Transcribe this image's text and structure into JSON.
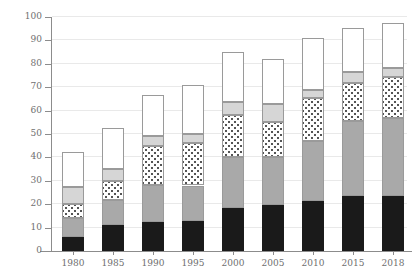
{
  "chart_data": {
    "type": "bar",
    "subtype": "stacked-bar",
    "title": "",
    "subtitle": "",
    "xlabel": "",
    "ylabel": "",
    "grid": true,
    "legend_position": "none",
    "categories": [
      "1980",
      "1985",
      "1990",
      "1995",
      "2000",
      "2005",
      "2010",
      "2015",
      "2018"
    ],
    "ylim": [
      0,
      100
    ],
    "yticks": [
      0,
      10,
      20,
      30,
      40,
      50,
      60,
      70,
      80,
      90,
      100
    ],
    "ytick_labels": [
      "0",
      "10",
      "20",
      "30",
      "40",
      "50",
      "60",
      "70",
      "80",
      "90",
      "100"
    ],
    "series": [
      {
        "name": "segment-1",
        "fill": "solid-black",
        "color": "#1a1a1a",
        "values": [
          6,
          11,
          12.5,
          13,
          18.5,
          19.5,
          21.5,
          23.5,
          23.5
        ]
      },
      {
        "name": "segment-2",
        "fill": "solid-gray",
        "color": "#a9a9a9",
        "values": [
          8,
          11,
          15.5,
          15,
          21.5,
          20.5,
          25.5,
          32,
          33.5
        ]
      },
      {
        "name": "segment-3",
        "fill": "dotted",
        "color": "#ffffff",
        "values": [
          6,
          8,
          17,
          18,
          18,
          15,
          18.5,
          16.5,
          17.5
        ]
      },
      {
        "name": "segment-4",
        "fill": "light-gray",
        "color": "#d6d6d6",
        "values": [
          7.5,
          5,
          4,
          4,
          5.5,
          8,
          3.5,
          4.5,
          3.5
        ]
      },
      {
        "name": "segment-5",
        "fill": "solid-white",
        "color": "#ffffff",
        "values": [
          15,
          17.5,
          17.5,
          21,
          21.5,
          19,
          22,
          19,
          19.5
        ]
      }
    ],
    "totals": [
      42.5,
      52.5,
      66.5,
      71,
      85,
      82,
      91,
      95.5,
      97.5
    ],
    "cumulative_tops": [
      [
        6,
        14,
        20,
        27.5,
        42.5
      ],
      [
        11,
        22,
        30,
        35,
        52.5
      ],
      [
        12.5,
        28,
        45,
        49,
        66.5
      ],
      [
        13,
        28,
        46,
        50,
        71
      ],
      [
        18.5,
        40,
        58,
        63.5,
        85
      ],
      [
        19.5,
        40,
        55,
        63,
        82
      ],
      [
        21.5,
        47,
        65.5,
        69,
        91
      ],
      [
        23.5,
        55.5,
        72,
        76.5,
        95.5
      ],
      [
        23.5,
        57,
        74.5,
        78,
        97.5
      ]
    ]
  },
  "style": {
    "axis_color": "#8c8c8c",
    "grid_color": "#e9e9e9",
    "text_color": "#6f6f6f",
    "background": "#ffffff"
  }
}
